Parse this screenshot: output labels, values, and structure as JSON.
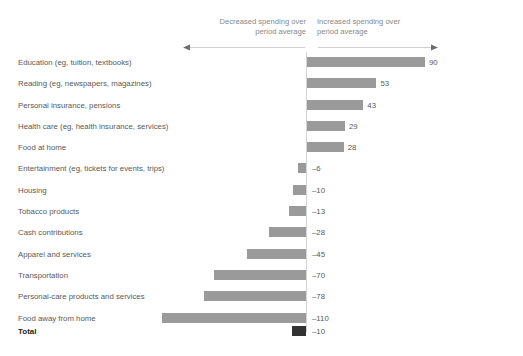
{
  "header": {
    "decreased_caption": "Decreased spending over\nperiod average",
    "increased_caption": "Increased spending over\nperiod average",
    "left_arrow_icon": "arrow-left-icon",
    "right_arrow_icon": "arrow-right-icon"
  },
  "total": {
    "label": "Total",
    "value": "–10",
    "value_number": -10,
    "color": "#333335"
  },
  "colors": {
    "bar": "#9a9a9a",
    "total_bar": "#333335",
    "zero_line": "#d3d3d3",
    "label_text": "#58595b",
    "caption_text": "#87888a",
    "background": "#ffffff"
  },
  "chart_data": {
    "type": "bar",
    "orientation": "horizontal",
    "title": "",
    "subtitle": "",
    "xlabel": "",
    "ylabel": "",
    "xlim": [
      -110,
      90
    ],
    "grid": false,
    "legend": null,
    "zero_reference": 0,
    "annotations": [
      "Decreased spending over period average",
      "Increased spending over period average"
    ],
    "categories": [
      "Education (eg, tuition, textbooks)",
      "Reading (eg, newspapers, magazines)",
      "Personal insurance, pensions",
      "Health care (eg, health insurance, services)",
      "Food at home",
      "Entertainment (eg, tickets for events, trips)",
      "Housing",
      "Tobacco products",
      "Cash contributions",
      "Apparel and services",
      "Transportation",
      "Personal-care products and services",
      "Food away from home"
    ],
    "values": [
      90,
      53,
      43,
      29,
      28,
      -6,
      -10,
      -13,
      -28,
      -45,
      -70,
      -78,
      -110
    ],
    "value_labels": [
      "90",
      "53",
      "43",
      "29",
      "28",
      "–6",
      "–10",
      "–13",
      "–28",
      "–45",
      "–70",
      "–78",
      "–110"
    ],
    "total": {
      "category": "Total",
      "value": -10,
      "label": "–10"
    }
  }
}
